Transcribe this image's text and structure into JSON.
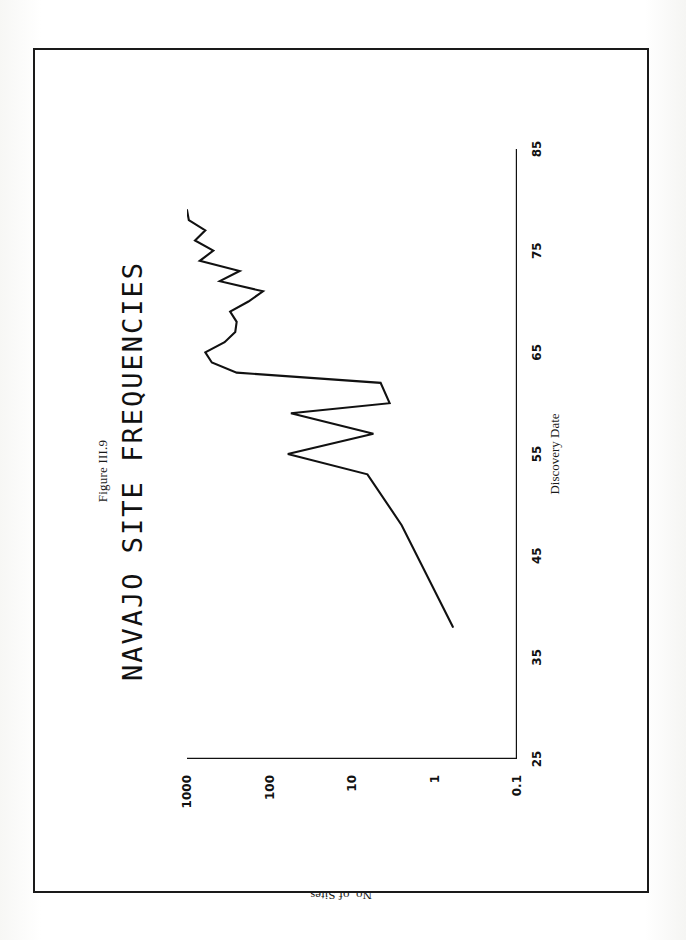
{
  "figure": {
    "caption": "Figure III.9",
    "title": "NAVAJO SITE FREQUENCIES"
  },
  "chart_data": {
    "type": "line",
    "title": "NAVAJO SITE FREQUENCIES",
    "subtitle": "Figure III.9",
    "xlabel": "Discovery Date",
    "ylabel": "No. of Sites",
    "xlim": [
      25,
      85
    ],
    "ylim": [
      0.1,
      1000
    ],
    "yscale": "log",
    "xscale": "linear",
    "grid": false,
    "legend": null,
    "xticks": [
      25,
      35,
      45,
      55,
      65,
      75,
      85
    ],
    "xtick_labels": [
      "25",
      "35",
      "45",
      "55",
      "65",
      "75",
      "85"
    ],
    "yticks": [
      0.1,
      1,
      10,
      100,
      1000
    ],
    "ytick_labels": [
      "0.1",
      "1",
      "10",
      "100",
      "1000"
    ],
    "y_minor_ticks": true,
    "series": [
      {
        "name": "No. of Sites",
        "x": [
          38,
          48,
          53,
          55,
          57,
          59,
          60,
          62,
          63,
          64,
          65,
          66,
          67,
          68,
          69,
          70,
          71,
          72,
          73,
          74,
          75,
          76,
          77,
          78,
          79
        ],
        "y": [
          0.6,
          2.5,
          6.5,
          60,
          5.5,
          55,
          3.5,
          4.5,
          250,
          500,
          600,
          350,
          260,
          250,
          300,
          180,
          120,
          400,
          230,
          700,
          480,
          800,
          600,
          950,
          1000
        ]
      }
    ]
  },
  "xticks_px": [
    {
      "label": "25",
      "pos": 0
    },
    {
      "label": "35",
      "pos": 101.67
    },
    {
      "label": "45",
      "pos": 203.33
    },
    {
      "label": "55",
      "pos": 305
    },
    {
      "label": "65",
      "pos": 406.67
    },
    {
      "label": "75",
      "pos": 508.33
    },
    {
      "label": "85",
      "pos": 610
    }
  ],
  "yticks_px": [
    {
      "label": "0.1",
      "pos": 330
    },
    {
      "label": "1",
      "pos": 247.5
    },
    {
      "label": "10",
      "pos": 165
    },
    {
      "label": "100",
      "pos": 82.5
    },
    {
      "label": "1000",
      "pos": 0
    }
  ],
  "colors": {
    "ink": "#111111",
    "paper": "#ffffff",
    "page_border": "#1a1a1a"
  }
}
